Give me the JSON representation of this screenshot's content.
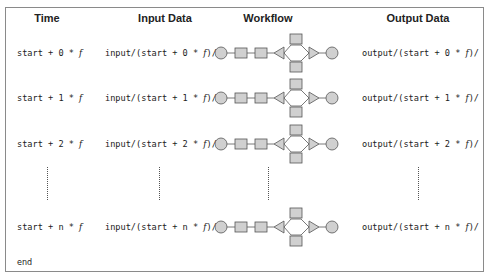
{
  "headers": {
    "time": "Time",
    "input": "Input Data",
    "workflow": "Workflow",
    "output": "Output Data"
  },
  "rows": [
    {
      "time_pre": "start + 0 * ",
      "time_var": "f",
      "input_pre": "input/(start + 0 * ",
      "input_var": "f",
      "input_post": ")/",
      "output_pre": "output/(start + 0 * ",
      "output_var": "f",
      "output_post": ")/"
    },
    {
      "time_pre": "start + 1 * ",
      "time_var": "f",
      "input_pre": "input/(start + 1 * ",
      "input_var": "f",
      "input_post": ")/",
      "output_pre": "output/(start + 1 * ",
      "output_var": "f",
      "output_post": ")/"
    },
    {
      "time_pre": "start + 2 * ",
      "time_var": "f",
      "input_pre": "input/(start + 2 * ",
      "input_var": "f",
      "input_post": ")/",
      "output_pre": "output/(start + 2 * ",
      "output_var": "f",
      "output_post": ")/"
    },
    {
      "time_pre": "start + n * ",
      "time_var": "f",
      "input_pre": "input/(start + n * ",
      "input_var": "f",
      "input_post": ")/",
      "output_pre": "output/(start + n * ",
      "output_var": "f",
      "output_post": ")/"
    }
  ],
  "end_label": "end",
  "workflow_diagram": {
    "nodes": [
      "circle-start",
      "rect-task-1",
      "rect-task-2",
      "triangle-split",
      "rect-branch-top",
      "rect-branch-bottom",
      "triangle-join",
      "circle-end"
    ],
    "colors": {
      "fill": "#d0d0d0",
      "stroke": "#555555"
    }
  }
}
